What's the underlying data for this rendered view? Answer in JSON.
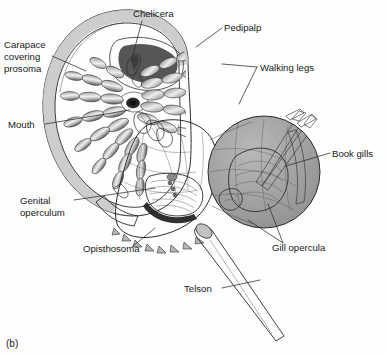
{
  "figure": {
    "caption": "(b)",
    "background_color": "#fefefe"
  },
  "palette": {
    "carapace_rim": "#bdbdbd",
    "carapace_body": "#a6a6a6",
    "carapace_inner": "#9b9b9b",
    "recess_dark": "#6b6b6b",
    "recess_darker": "#4e4e4e",
    "opisthosoma": "#a2a2a2",
    "limb_light": "#e3e3e3",
    "limb_mid": "#b4b4b4",
    "limb_dark": "#7d7d7d",
    "telson": "#b0b0b0",
    "outline": "#2b2b2b",
    "text": "#18181a",
    "inset_fill": "#a9a9a9",
    "gill_dark": "#222222"
  },
  "labels": [
    {
      "id": "carapace",
      "name": "label-carapace",
      "lines": [
        "Carapace",
        "covering",
        "prosoma"
      ],
      "text_x": 4,
      "text_y": 48,
      "line_height": 12,
      "anchor": "start",
      "leader": "M52,56 L86,71"
    },
    {
      "id": "chelicera",
      "name": "label-chelicera",
      "lines": [
        "Chelicera"
      ],
      "text_x": 133,
      "text_y": 17,
      "line_height": 12,
      "anchor": "start",
      "leader": "M142,21 L131,62"
    },
    {
      "id": "pedipalp",
      "name": "label-pedipalp",
      "lines": [
        "Pedipalp"
      ],
      "text_x": 224,
      "text_y": 31,
      "line_height": 12,
      "anchor": "start",
      "leader": "M222,28 L196,47"
    },
    {
      "id": "walking-legs",
      "name": "label-walking-legs",
      "lines": [
        "Walking legs"
      ],
      "text_x": 260,
      "text_y": 71,
      "line_height": 12,
      "anchor": "start",
      "leader": "M257,67 L222,64 M257,67 L239,104"
    },
    {
      "id": "mouth",
      "name": "label-mouth",
      "lines": [
        "Mouth"
      ],
      "text_x": 8,
      "text_y": 128,
      "line_height": 12,
      "anchor": "start",
      "leader": "M45,124 L130,110"
    },
    {
      "id": "book-gills",
      "name": "label-book-gills",
      "lines": [
        "Book gills"
      ],
      "text_x": 332,
      "text_y": 157,
      "line_height": 12,
      "anchor": "start",
      "leader": "M330,153 L286,166"
    },
    {
      "id": "genital-operculum",
      "name": "label-genital-operculum",
      "lines": [
        "Genital",
        "operculum"
      ],
      "text_x": 20,
      "text_y": 204,
      "line_height": 12,
      "anchor": "start",
      "leader": "M74,200 L155,188"
    },
    {
      "id": "opisthosoma",
      "name": "label-opisthosoma",
      "lines": [
        "Opisthosoma"
      ],
      "text_x": 83,
      "text_y": 252,
      "line_height": 12,
      "anchor": "start",
      "leader": "M132,247 L155,228"
    },
    {
      "id": "gill-opercula",
      "name": "label-gill-opercula",
      "lines": [
        "Gill opercula"
      ],
      "text_x": 272,
      "text_y": 251,
      "line_height": 12,
      "anchor": "start",
      "leader": "M283,243 L248,220 M283,243 L268,204"
    },
    {
      "id": "telson",
      "name": "label-telson",
      "lines": [
        "Telson"
      ],
      "text_x": 184,
      "text_y": 292,
      "line_height": 12,
      "anchor": "start",
      "leader": "M222,288 L260,280"
    }
  ],
  "anatomy": {
    "parts": [
      "carapace-prosoma",
      "chelicera",
      "pedipalp",
      "walking-legs",
      "mouth",
      "opisthosoma",
      "genital-operculum",
      "gill-opercula",
      "book-gills",
      "telson"
    ],
    "inset": {
      "name": "book-gill-inset",
      "center_x": 264,
      "center_y": 172,
      "radius": 56
    }
  }
}
